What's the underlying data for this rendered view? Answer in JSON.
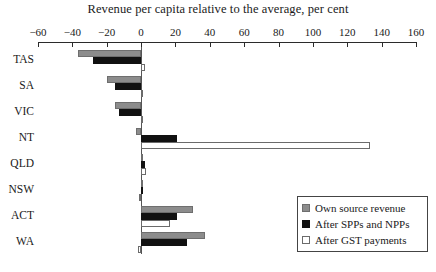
{
  "chart_data": {
    "type": "bar",
    "orientation": "horizontal",
    "title": "Revenue per capita relative to the average, per cent",
    "xlabel": "",
    "ylabel": "",
    "xlim": [
      -60,
      160
    ],
    "xticks": [
      -60,
      -40,
      -20,
      0,
      20,
      40,
      60,
      80,
      100,
      120,
      140,
      160
    ],
    "xticklabels": [
      "−60",
      "−40",
      "−20",
      "0",
      "20",
      "40",
      "60",
      "80",
      "100",
      "120",
      "140",
      "160"
    ],
    "grid": false,
    "legend_position": "bottom-right",
    "categories": [
      "TAS",
      "SA",
      "VIC",
      "NT",
      "QLD",
      "NSW",
      "ACT",
      "WA"
    ],
    "series": [
      {
        "name": "Own source revenue",
        "color": "#8c8c8c",
        "values": [
          -37,
          -20,
          -15,
          -3,
          1,
          0,
          30,
          37
        ]
      },
      {
        "name": "After SPPs and NPPs",
        "color": "#111111",
        "values": [
          -28,
          -15,
          -13,
          21,
          2,
          0,
          21,
          27
        ]
      },
      {
        "name": "After GST payments",
        "color": "#ffffff",
        "values": [
          2,
          0,
          0,
          133,
          3,
          -1,
          17,
          -2
        ]
      }
    ]
  },
  "legend": {
    "entries": [
      {
        "label": "Own source revenue"
      },
      {
        "label": "After SPPs and NPPs"
      },
      {
        "label": "After GST payments"
      }
    ]
  }
}
